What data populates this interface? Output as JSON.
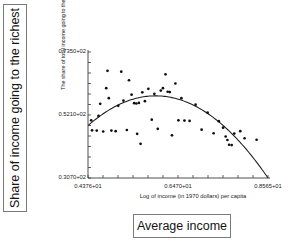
{
  "annotations": {
    "left_box_label": "Share of income going to the richest",
    "bottom_box_label": "Average income"
  },
  "chart_data": {
    "type": "scatter",
    "title": "",
    "xlabel": "Log of income (in 1970 dollars) per capita",
    "ylabel": "The share of total income going to the top 20%",
    "xtick_labels": [
      "0.4376+01",
      "0.6470+01",
      "0.8565+01"
    ],
    "ytick_labels": [
      "0.3070+02",
      "0.5210+02",
      "0.7350+02"
    ],
    "xlim": [
      4.376,
      8.565
    ],
    "ylim": [
      30.7,
      73.5
    ],
    "grid": false,
    "legend": null,
    "marker": "filled-circle",
    "points": [
      {
        "x": 4.45,
        "y": 50.3
      },
      {
        "x": 4.47,
        "y": 46.9
      },
      {
        "x": 4.58,
        "y": 46.8
      },
      {
        "x": 4.62,
        "y": 51.8
      },
      {
        "x": 4.66,
        "y": 55.9
      },
      {
        "x": 4.73,
        "y": 46.5
      },
      {
        "x": 4.8,
        "y": 61.2
      },
      {
        "x": 4.83,
        "y": 67.1
      },
      {
        "x": 4.86,
        "y": 57.8
      },
      {
        "x": 4.92,
        "y": 46.8
      },
      {
        "x": 5.02,
        "y": 46.6
      },
      {
        "x": 5.08,
        "y": 55.2
      },
      {
        "x": 5.15,
        "y": 66.8
      },
      {
        "x": 5.2,
        "y": 57.0
      },
      {
        "x": 5.28,
        "y": 47.0
      },
      {
        "x": 5.33,
        "y": 63.9
      },
      {
        "x": 5.39,
        "y": 59.0
      },
      {
        "x": 5.45,
        "y": 56.1
      },
      {
        "x": 5.5,
        "y": 56.0
      },
      {
        "x": 5.52,
        "y": 45.7
      },
      {
        "x": 5.56,
        "y": 56.2
      },
      {
        "x": 5.6,
        "y": 42.3
      },
      {
        "x": 5.64,
        "y": 59.8
      },
      {
        "x": 5.7,
        "y": 56.8
      },
      {
        "x": 5.78,
        "y": 61.0
      },
      {
        "x": 5.86,
        "y": 50.5
      },
      {
        "x": 5.92,
        "y": 59.3
      },
      {
        "x": 6.0,
        "y": 47.4
      },
      {
        "x": 6.07,
        "y": 60.4
      },
      {
        "x": 6.12,
        "y": 61.2
      },
      {
        "x": 6.18,
        "y": 65.9
      },
      {
        "x": 6.23,
        "y": 60.0
      },
      {
        "x": 6.28,
        "y": 59.9
      },
      {
        "x": 6.33,
        "y": 45.2
      },
      {
        "x": 6.41,
        "y": 62.8
      },
      {
        "x": 6.48,
        "y": 50.3
      },
      {
        "x": 6.55,
        "y": 57.8
      },
      {
        "x": 6.62,
        "y": 50.2
      },
      {
        "x": 6.74,
        "y": 50.1
      },
      {
        "x": 6.88,
        "y": 55.6
      },
      {
        "x": 7.02,
        "y": 47.1
      },
      {
        "x": 7.16,
        "y": 52.9
      },
      {
        "x": 7.3,
        "y": 45.9
      },
      {
        "x": 7.42,
        "y": 50.0
      },
      {
        "x": 7.52,
        "y": 47.8
      },
      {
        "x": 7.58,
        "y": 44.8
      },
      {
        "x": 7.62,
        "y": 43.6
      },
      {
        "x": 7.66,
        "y": 42.0
      },
      {
        "x": 7.72,
        "y": 41.9
      },
      {
        "x": 7.78,
        "y": 45.8
      },
      {
        "x": 7.92,
        "y": 46.6
      },
      {
        "x": 8.02,
        "y": 44.2
      },
      {
        "x": 8.3,
        "y": 43.7
      }
    ],
    "fit_curve": {
      "name": "quadratic-fit",
      "shape": "inverted-u",
      "vertex": {
        "x": 5.95,
        "y": 58.6
      },
      "endpoints": [
        {
          "x": 4.38,
          "y": 49.8
        },
        {
          "x": 8.565,
          "y": 30.7
        }
      ]
    }
  }
}
